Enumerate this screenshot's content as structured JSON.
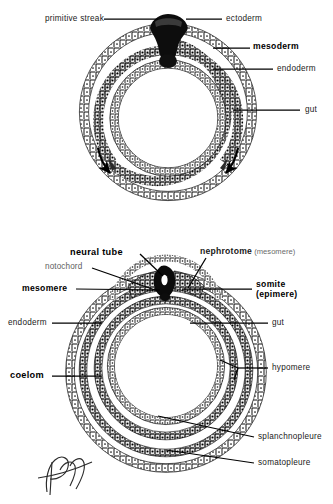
{
  "figure": {
    "title_visible": false,
    "background": "#ffffff",
    "ink": "#000000",
    "panels": [
      {
        "id": "upper",
        "name": "gastrulation-cross-section",
        "description": "Circular embryo cross-section with primitive streak at top ingressing to form mesoderm between ectoderm and endoderm; arrows show mesoderm migration",
        "labels": [
          {
            "key": "primitive_streak",
            "text": "primitive streak",
            "weight": "regular",
            "side": "left",
            "x": 24,
            "y": 15,
            "leader_from": [
              104,
              19
            ],
            "leader_to": [
              156,
              19
            ]
          },
          {
            "key": "ectoderm",
            "text": "ectoderm",
            "weight": "regular",
            "side": "right",
            "x": 225,
            "y": 15,
            "leader_from": [
              222,
              19
            ],
            "leader_to": [
              186,
              19
            ]
          },
          {
            "key": "mesoderm",
            "text": "mesoderm",
            "weight": "bold",
            "side": "right",
            "x": 253,
            "y": 44,
            "leader_from": [
              250,
              48
            ],
            "leader_to": [
              213,
              48
            ]
          },
          {
            "key": "endoderm",
            "text": "endoderm",
            "weight": "regular",
            "side": "right",
            "x": 276,
            "y": 65,
            "leader_from": [
              273,
              69
            ],
            "leader_to": [
              213,
              69
            ]
          },
          {
            "key": "gut",
            "text": "gut",
            "weight": "regular",
            "side": "right",
            "x": 305,
            "y": 105,
            "leader_from": [
              300,
              110
            ],
            "leader_to": [
              233,
              110
            ]
          }
        ],
        "arrows": [
          {
            "key": "mesoderm-flow-left",
            "name": "migration-arrow-left"
          },
          {
            "key": "mesoderm-flow-right",
            "name": "migration-arrow-right"
          }
        ]
      },
      {
        "id": "lower",
        "name": "neurulation-cross-section",
        "description": "Circular embryo cross-section after neurulation showing neural tube, notochord, somite, nephrotome, hypomere, coelom, splanchnopleure and somatopleure",
        "labels": [
          {
            "key": "neural_tube",
            "text": "neural tube",
            "weight": "bold",
            "side": "top-left",
            "x": 72,
            "y": 249,
            "leader_from": [
              140,
              254
            ],
            "leader_to": [
              163,
              276
            ]
          },
          {
            "key": "notochord",
            "text": "notochord",
            "weight": "regular",
            "side": "left",
            "x": 46,
            "y": 263,
            "leader_from": [
              92,
              268
            ],
            "leader_to": [
              158,
              289
            ]
          },
          {
            "key": "mesomere",
            "text": "mesomere",
            "weight": "bold",
            "side": "left",
            "x": 22,
            "y": 284,
            "leader_from": [
              76,
              289
            ],
            "leader_to": [
              160,
              289
            ]
          },
          {
            "key": "nephrotome",
            "text": "nephrotome",
            "weight": "bold",
            "side": "right",
            "x": 200,
            "y": 249,
            "suffix": "(mesomere)",
            "leader_from": [
              206,
              258
            ],
            "leader_to": [
              188,
              288
            ]
          },
          {
            "key": "somite",
            "text": "somite",
            "weight": "bold",
            "side": "right",
            "x": 256,
            "y": 281,
            "second_line": "(epimere)",
            "leader_from": [
              252,
              289
            ],
            "leader_to": [
              182,
              289
            ]
          },
          {
            "key": "endoderm",
            "text": "endoderm",
            "weight": "regular",
            "side": "left",
            "x": 8,
            "y": 319,
            "leader_from": [
              52,
              323
            ],
            "leader_to": [
              100,
              323
            ]
          },
          {
            "key": "gut",
            "text": "gut",
            "weight": "regular",
            "side": "right",
            "x": 272,
            "y": 319,
            "leader_from": [
              268,
              323
            ],
            "leader_to": [
              190,
              323
            ]
          },
          {
            "key": "coelom",
            "text": "coelom",
            "weight": "bold",
            "side": "left",
            "x": 10,
            "y": 372,
            "leader_from": [
              52,
              376
            ],
            "leader_to": [
              100,
              376
            ]
          },
          {
            "key": "hypomere",
            "text": "hypomere",
            "weight": "regular",
            "side": "right",
            "x": 272,
            "y": 364,
            "leader_from": [
              268,
              368
            ],
            "leader_to": [
              222,
              362
            ],
            "leader_to_2": [
              235,
              378
            ]
          },
          {
            "key": "splanchnopleure",
            "text": "splanchnopleure",
            "weight": "regular",
            "side": "right",
            "x": 258,
            "y": 433,
            "leader_from": [
              254,
              437
            ],
            "leader_to": [
              160,
              418
            ]
          },
          {
            "key": "somatopleure",
            "text": "somatopleure",
            "weight": "regular",
            "side": "right",
            "x": 258,
            "y": 459,
            "leader_from": [
              254,
              463
            ],
            "leader_to": [
              168,
              452
            ]
          }
        ]
      }
    ],
    "signature": {
      "name": "artist-signature",
      "present": true,
      "x": 38,
      "y": 452
    }
  }
}
